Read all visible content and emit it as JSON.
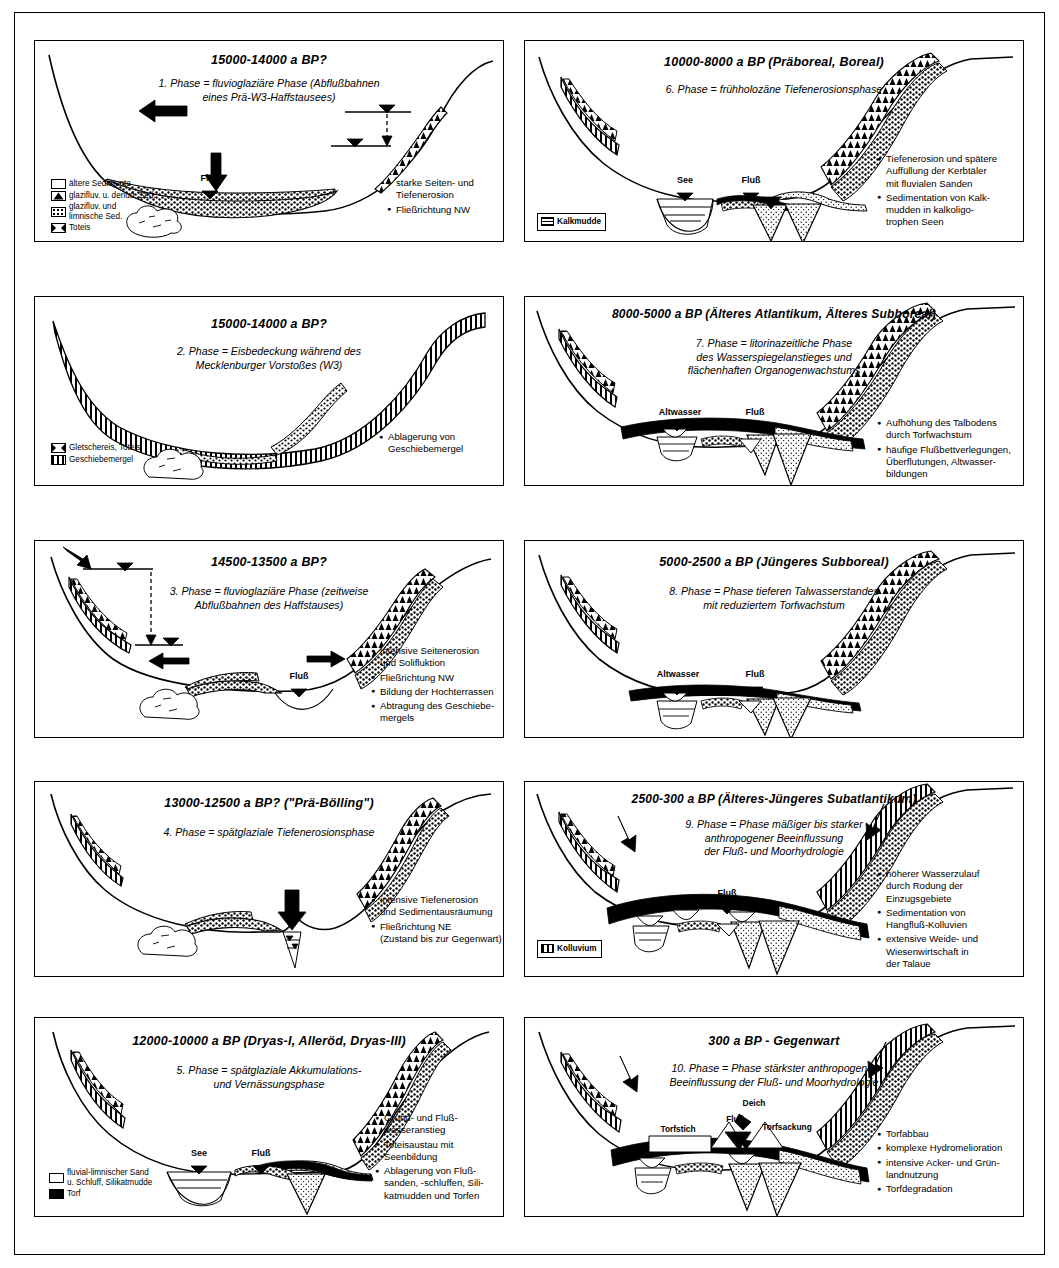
{
  "figure": {
    "panel_count": 10,
    "columns": 2
  },
  "panels": [
    {
      "id": "p1",
      "title": "15000-14000 a BP?",
      "subtitle": "1. Phase = fluvioglaziäre Phase (Abflußbahnen\neines Prä-W3-Haffstausees)",
      "water_labels": [
        "Fluß"
      ],
      "bullets": [
        "starke Seiten- und\nTiefenerosion",
        "Fließrichtung NW"
      ],
      "legend": [
        {
          "pattern": "blank",
          "text": "ältere Sedimente"
        },
        {
          "pattern": "triangles",
          "text": "glazifluv. u. denud. Sed."
        },
        {
          "pattern": "dots",
          "text": "glazifluv. und\nlimnische Sed."
        },
        {
          "pattern": "deadice",
          "text": "Toteis"
        }
      ]
    },
    {
      "id": "p2",
      "title": "15000-14000 a BP?",
      "subtitle": "2. Phase = Eisbedeckung während des\nMecklenburger Vorstoßes (W3)",
      "water_labels": [],
      "bullets": [
        "Ablagerung von\nGeschiebemergel"
      ],
      "legend": [
        {
          "pattern": "deadice",
          "text": "Gletschereis, Toteis"
        },
        {
          "pattern": "vbars",
          "text": "Geschiebemergel"
        }
      ]
    },
    {
      "id": "p3",
      "title": "14500-13500 a BP?",
      "subtitle": "3. Phase = fluvioglaziäre Phase (zeitweise\nAbflußbahnen des Haffstauses)",
      "water_labels": [
        "Fluß"
      ],
      "bullets": [
        "intensive Seitenerosion\nund Solifluktion",
        "Fließrichtung NW",
        "Bildung der Hochterrassen",
        "Abtragung des Geschiebe-\nmergels"
      ],
      "legend": []
    },
    {
      "id": "p4",
      "title": "13000-12500 a BP? (\"Prä-Bölling\")",
      "subtitle": "4. Phase = spätglaziale Tiefenerosionsphase",
      "water_labels": [],
      "bullets": [
        "intensive Tiefenerosion\nund Sedimentausräumung",
        "Fließrichtung NE\n(Zustand bis zur Gegenwart)"
      ],
      "legend": []
    },
    {
      "id": "p5",
      "title": "12000-10000 a BP (Dryas-I, Alleröd, Dryas-III)",
      "subtitle": "5. Phase = spätglaziale Akkumulations-\nund Vernässungsphase",
      "water_labels": [
        "See",
        "Fluß"
      ],
      "bullets": [
        "Grund- und Fluß-\nwasseranstieg",
        "Toteisaustau mit\nSeenbildung",
        "Ablagerung von Fluß-\nsanden, -schluffen, Sili-\nkatmudden und Torfen"
      ],
      "legend": [
        {
          "pattern": "blank",
          "text": "fluvial-limnischer Sand\nu. Schluff, Silikatmudde"
        },
        {
          "pattern": "solid",
          "text": "Torf"
        }
      ]
    },
    {
      "id": "p6",
      "title": "10000-8000 a BP (Präboreal, Boreal)",
      "subtitle": "6. Phase = frühholozäne Tiefenerosionsphase",
      "water_labels": [
        "See",
        "Fluß"
      ],
      "bullets": [
        "Tiefenerosion und spätere\nAuffüllung der Kerbtäler\nmit fluvialen Sanden",
        "Sedimentation von Kalk-\nmudden in kalkoligo-\ntrophen Seen"
      ],
      "legend": [
        {
          "pattern": "hlines",
          "text": "Kalkmudde"
        }
      ]
    },
    {
      "id": "p7",
      "title": "8000-5000 a BP (Älteres Atlantikum, Älteres Subboreal)",
      "subtitle": "7. Phase = litorinazeitliche Phase\ndes Wasserspiegelanstieges und\nflächenhaften Organogenwachstums",
      "water_labels": [
        "Altwasser",
        "Fluß"
      ],
      "bullets": [
        "Aufhöhung des Talbodens\ndurch Torfwachstum",
        "häufige Flußbettverlegungen,\nÜberflutungen, Altwasser-\nbildungen"
      ],
      "legend": []
    },
    {
      "id": "p8",
      "title": "5000-2500 a BP (Jüngeres Subboreal)",
      "subtitle": "8. Phase = Phase tieferen Talwasserstandes\nmit reduziertem Torfwachstum",
      "water_labels": [
        "Altwasser",
        "Fluß"
      ],
      "bullets": [],
      "legend": []
    },
    {
      "id": "p9",
      "title": "2500-300 a BP (Älteres-Jüngeres Subatlantikum)",
      "subtitle": "9. Phase = Phase mäßiger bis starker\nanthropogener Beeinflussung\nder Fluß- und Moorhydrologie",
      "water_labels": [
        "Fluß"
      ],
      "bullets": [
        "höherer Wasserzulauf\ndurch Rodung der\nEinzugsgebiete",
        "Sedimentation von\nHangfluß-Kolluvien",
        "extensive Weide- und\nWiesenwirtschaft in\nder Talaue"
      ],
      "legend": [
        {
          "pattern": "vbars",
          "text": "Kolluvium"
        }
      ]
    },
    {
      "id": "p10",
      "title": "300 a BP - Gegenwart",
      "subtitle": "10. Phase = Phase stärkster anthropogener\nBeeinflussung der Fluß- und Moorhydrologie",
      "water_labels": [
        "Torfstich",
        "Fluß",
        "Deich",
        "Torfsackung"
      ],
      "bullets": [
        "Torfabbau",
        "komplexe Hydromelioration",
        "intensive Acker- und Grün-\nlandnutzung",
        "Torfdegradation"
      ],
      "legend": []
    }
  ]
}
